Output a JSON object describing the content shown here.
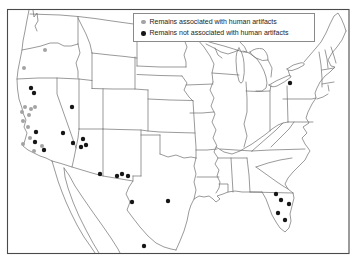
{
  "figure": {
    "type": "distribution map",
    "region": "Contiguous United States with state boundaries, southern Canada and northern Mexico",
    "background_color": "#ffffff",
    "frame_color": "#4a4a4a",
    "boundary_line_color": "#6e6e6e"
  },
  "legend": {
    "position": "top-right inset box",
    "border_color": "#8a8a8a"
  },
  "chart_data": {
    "type": "scatter",
    "legend_position": "top-right-inset",
    "coordinate_space": {
      "width": 358,
      "height": 262,
      "units": "figure pixels"
    },
    "series": [
      {
        "name": "Remains associated with human artifacts",
        "color": "#a3a3a3",
        "marker": "dot",
        "radius": 2,
        "locations_note": "Oregon and coastal/central California",
        "points": [
          [
            45,
            50
          ],
          [
            24,
            68
          ],
          [
            25,
            107
          ],
          [
            31,
            109
          ],
          [
            35,
            107
          ],
          [
            22,
            112
          ],
          [
            29,
            115
          ],
          [
            23,
            121
          ],
          [
            28,
            127
          ],
          [
            30,
            138
          ],
          [
            23,
            144
          ],
          [
            42,
            146
          ],
          [
            34,
            151
          ]
        ]
      },
      {
        "name": "Remains not associated with human artifacts",
        "color": "#161616",
        "marker": "dot",
        "radius": 2.2,
        "locations_note": "Northern California, Nevada, Arizona, New Mexico, Texas, northern Mexico, western New York, Florida",
        "points": [
          [
            31,
            88
          ],
          [
            34,
            93
          ],
          [
            72,
            107
          ],
          [
            63,
            133
          ],
          [
            36,
            132
          ],
          [
            35,
            142
          ],
          [
            44,
            150
          ],
          [
            73,
            143
          ],
          [
            83,
            139
          ],
          [
            81,
            147
          ],
          [
            86,
            145
          ],
          [
            100,
            174
          ],
          [
            117,
            176
          ],
          [
            122,
            174
          ],
          [
            128,
            176
          ],
          [
            132,
            202
          ],
          [
            168,
            201
          ],
          [
            144,
            246
          ],
          [
            290,
            83
          ],
          [
            276,
            194
          ],
          [
            281,
            200
          ],
          [
            289,
            204
          ],
          [
            278,
            213
          ],
          [
            285,
            220
          ]
        ]
      }
    ]
  }
}
